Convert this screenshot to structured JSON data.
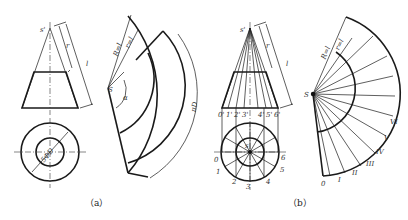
{
  "figure": {
    "panels": [
      {
        "id": "a",
        "caption": "（a）",
        "front_view": {
          "apex_label": "s'",
          "dim_small": "r",
          "dim_large": "l"
        },
        "top_view": {
          "dim_label": "5ΦD"
        },
        "development": {
          "apex_label": "S",
          "radius_outer": "R=l",
          "radius_inner": "r=l",
          "angle_label": "α",
          "arc_label": "πD"
        }
      },
      {
        "id": "b",
        "caption": "（b）",
        "front_view": {
          "apex_label": "s'",
          "dim_small": "r",
          "dim_large": "l",
          "base_labels": [
            "0'",
            "1'",
            "2'",
            "3'",
            "4'",
            "5'",
            "6'"
          ]
        },
        "top_view": {
          "center_label": "s",
          "point_labels": [
            "0",
            "1",
            "2",
            "3",
            "4",
            "5",
            "6"
          ]
        },
        "development": {
          "apex_label": "S",
          "radius_outer": "R=l",
          "radius_inner": "r=l",
          "generator_labels": [
            "0",
            "I",
            "II",
            "III",
            "IV",
            "V",
            "VI"
          ]
        }
      }
    ]
  }
}
